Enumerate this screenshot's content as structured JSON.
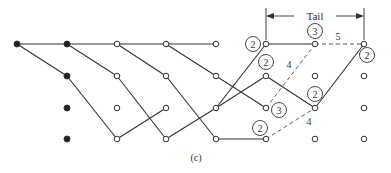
{
  "figure": {
    "caption": "(c)",
    "tail_label": "Tail",
    "columns_x": [
      17,
      67,
      117,
      166,
      216,
      266,
      315,
      364
    ],
    "rows_y": [
      44,
      76,
      108,
      139
    ],
    "nodes": [
      {
        "c": 0,
        "r": 0,
        "filled": true
      },
      {
        "c": 1,
        "r": 0,
        "filled": true
      },
      {
        "c": 1,
        "r": 1,
        "filled": true
      },
      {
        "c": 1,
        "r": 2,
        "filled": true
      },
      {
        "c": 1,
        "r": 3,
        "filled": true
      },
      {
        "c": 2,
        "r": 0
      },
      {
        "c": 2,
        "r": 1
      },
      {
        "c": 2,
        "r": 2
      },
      {
        "c": 2,
        "r": 3
      },
      {
        "c": 3,
        "r": 0
      },
      {
        "c": 3,
        "r": 1
      },
      {
        "c": 3,
        "r": 2
      },
      {
        "c": 3,
        "r": 3
      },
      {
        "c": 4,
        "r": 0
      },
      {
        "c": 4,
        "r": 1
      },
      {
        "c": 4,
        "r": 2
      },
      {
        "c": 4,
        "r": 3
      },
      {
        "c": 5,
        "r": 0
      },
      {
        "c": 5,
        "r": 1
      },
      {
        "c": 5,
        "r": 2
      },
      {
        "c": 5,
        "r": 3
      },
      {
        "c": 6,
        "r": 0
      },
      {
        "c": 6,
        "r": 1
      },
      {
        "c": 6,
        "r": 2
      },
      {
        "c": 6,
        "r": 3
      },
      {
        "c": 7,
        "r": 0
      },
      {
        "c": 7,
        "r": 1
      },
      {
        "c": 7,
        "r": 2
      },
      {
        "c": 7,
        "r": 3
      }
    ],
    "edges": [
      {
        "a": [
          0,
          0
        ],
        "b": [
          1,
          0
        ]
      },
      {
        "a": [
          1,
          0
        ],
        "b": [
          2,
          0
        ]
      },
      {
        "a": [
          2,
          0
        ],
        "b": [
          3,
          0
        ]
      },
      {
        "a": [
          3,
          0
        ],
        "b": [
          4,
          0
        ]
      },
      {
        "a": [
          0,
          0
        ],
        "b": [
          1,
          1
        ]
      },
      {
        "a": [
          1,
          1
        ],
        "b": [
          2,
          3
        ]
      },
      {
        "a": [
          2,
          3
        ],
        "b": [
          3,
          2
        ]
      },
      {
        "a": [
          1,
          0
        ],
        "b": [
          2,
          1
        ]
      },
      {
        "a": [
          2,
          1
        ],
        "b": [
          3,
          3
        ]
      },
      {
        "a": [
          3,
          3
        ],
        "b": [
          4,
          2
        ]
      },
      {
        "a": [
          4,
          2
        ],
        "b": [
          5,
          0
        ]
      },
      {
        "a": [
          5,
          0
        ],
        "b": [
          6,
          0
        ]
      },
      {
        "a": [
          2,
          0
        ],
        "b": [
          3,
          1
        ]
      },
      {
        "a": [
          3,
          1
        ],
        "b": [
          4,
          3
        ]
      },
      {
        "a": [
          4,
          3
        ],
        "b": [
          5,
          3
        ]
      },
      {
        "a": [
          3,
          0
        ],
        "b": [
          4,
          1
        ]
      },
      {
        "a": [
          4,
          1
        ],
        "b": [
          5,
          2
        ]
      },
      {
        "a": [
          4,
          2
        ],
        "b": [
          5,
          1
        ]
      },
      {
        "a": [
          5,
          1
        ],
        "b": [
          6,
          2
        ]
      },
      {
        "a": [
          6,
          2
        ],
        "b": [
          7,
          0
        ]
      },
      {
        "a": [
          5,
          2
        ],
        "b": [
          6,
          0
        ],
        "dashed": true,
        "label": "4",
        "lx": 289,
        "ly": 68
      },
      {
        "a": [
          6,
          0
        ],
        "b": [
          7,
          0
        ],
        "dashed": true,
        "label": "5",
        "lx": 338,
        "ly": 40
      },
      {
        "a": [
          5,
          3
        ],
        "b": [
          6,
          2
        ],
        "dashed": true,
        "label": "4",
        "lx": 309,
        "ly": 125
      }
    ],
    "circled_labels": [
      {
        "text": "2",
        "x": 253,
        "y": 44
      },
      {
        "text": "3",
        "x": 315,
        "y": 31
      },
      {
        "text": "2",
        "x": 367,
        "y": 55
      },
      {
        "text": "2",
        "x": 266,
        "y": 62
      },
      {
        "text": "3",
        "x": 279,
        "y": 110
      },
      {
        "text": "2",
        "x": 315,
        "y": 94
      },
      {
        "text": "2",
        "x": 260,
        "y": 128
      }
    ]
  }
}
